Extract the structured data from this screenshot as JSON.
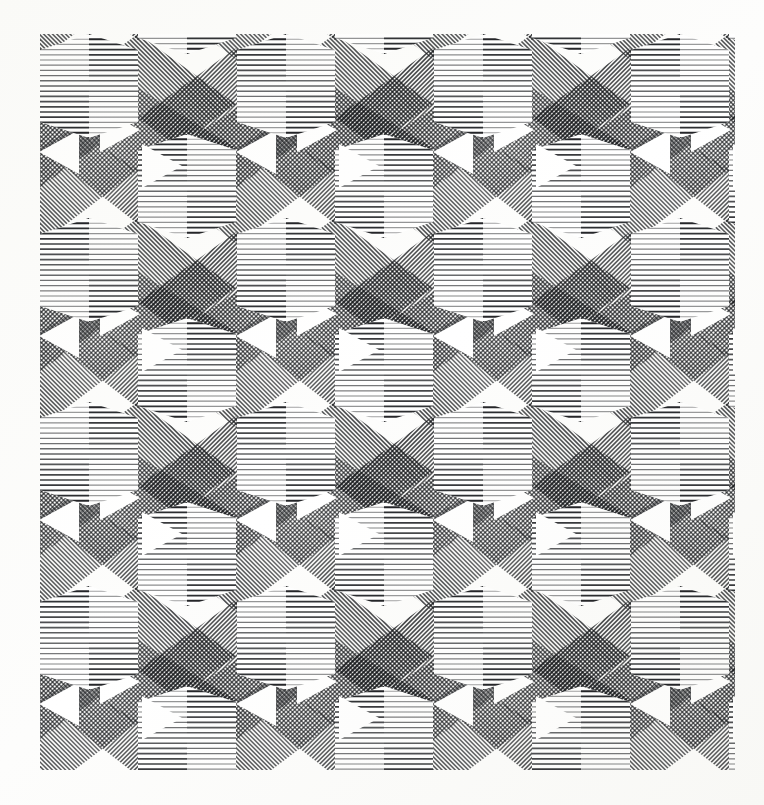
{
  "page": {
    "title": "Hatched Geometric Op-Art Print",
    "width": 764,
    "height": 805,
    "background_color": "#fdfdfc",
    "kind": "scanned-artwork"
  },
  "artwork": {
    "name": "tessellated-hatch-pattern",
    "description": "Monochrome hand-drawn op-art tessellation of hatched hexagonal columns, rhombi and white triangles",
    "ink_color": "#16181a",
    "paper_color": "#ffffff",
    "plate": {
      "x": 40,
      "y": 34,
      "width": 695,
      "height": 736
    },
    "lattice": {
      "period_x": 197,
      "period_y": 184,
      "column_width": 98,
      "band_block_height": 70,
      "row_offset_x": 98,
      "columns": 4,
      "rows": 5
    },
    "hatching": {
      "line_color": "#15171a",
      "line_width_min": 0.9,
      "line_width_max": 2.0,
      "horizontal_pitch": 5.2,
      "diagonal_pitch": 4.4,
      "diagonal_angle_a_deg": 45,
      "diagonal_angle_b_deg": -45,
      "gradient": "density ramps light-to-dark across each half-column"
    },
    "motifs": [
      {
        "name": "horizontal-band-column",
        "hatch": "horizontal",
        "count_per_tile": 1
      },
      {
        "name": "diagonal-rhombus-left",
        "hatch": "diagonal-45",
        "count_per_tile": 2
      },
      {
        "name": "diagonal-rhombus-right",
        "hatch": "diagonal-135",
        "count_per_tile": 2
      },
      {
        "name": "white-triangle-void",
        "hatch": "none",
        "count_per_tile": 2
      }
    ],
    "margins": {
      "left": 40,
      "top": 34,
      "right": 29,
      "bottom": 35
    }
  },
  "chart_data": {
    "type": "heatmap",
    "title": "Hatched Geometric Op-Art Print",
    "xlabel": "",
    "ylabel": "",
    "categories": [
      "col-1",
      "col-2",
      "col-3",
      "col-4"
    ],
    "values": [
      4,
      5,
      4,
      5
    ],
    "note": "Decorative tessellation; no quantitative data is encoded."
  }
}
